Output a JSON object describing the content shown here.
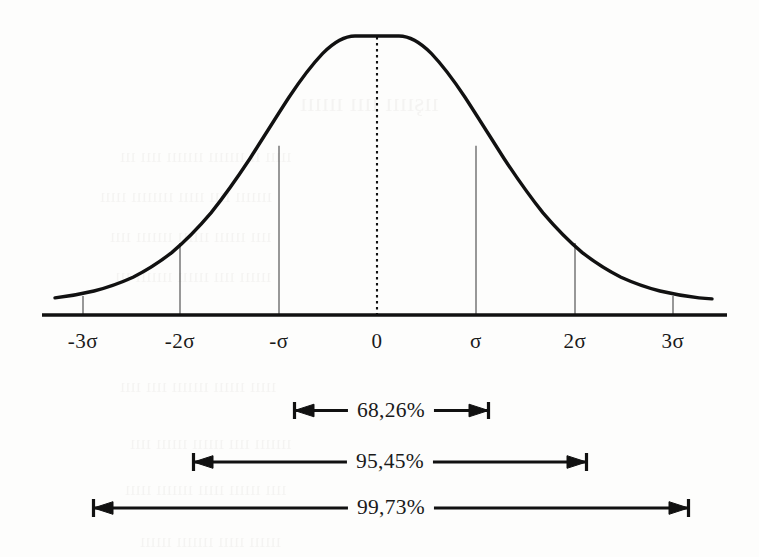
{
  "figure": {
    "background_color": "#fdfdfc",
    "ink_color": "#1a1a1a",
    "tick_color": "#555555"
  },
  "axis": {
    "labels": [
      {
        "text": "-3σ",
        "x": 83
      },
      {
        "text": "-2σ",
        "x": 180
      },
      {
        "text": "-σ",
        "x": 279
      },
      {
        "text": "0",
        "x": 377
      },
      {
        "text": "σ",
        "x": 476
      },
      {
        "text": "2σ",
        "x": 575
      },
      {
        "text": "3σ",
        "x": 673
      }
    ]
  },
  "bands": [
    {
      "label": "68,26%",
      "sigma": 1,
      "x_left": 293,
      "x_right": 490,
      "y": 410,
      "center": 391
    },
    {
      "label": "95,45%",
      "sigma": 2,
      "x_left": 192,
      "x_right": 588,
      "y": 462,
      "center": 390
    },
    {
      "label": "99,73%",
      "sigma": 3,
      "x_left": 92,
      "x_right": 690,
      "y": 508,
      "center": 391
    }
  ],
  "bleed_through": [
    {
      "text": "ıışıııı ıııı ıııııı",
      "x": 300,
      "y": 88,
      "size": 26
    },
    {
      "text": "ııııı ıı ııııııı ııııııı ıııı ııı",
      "x": 120,
      "y": 145,
      "size": 19
    },
    {
      "text": "ııııııı ıııı ııııı ıııııııı ııııı",
      "x": 100,
      "y": 185,
      "size": 19
    },
    {
      "text": "ıııı ıııııı ıııııı ııııııı ıııı",
      "x": 110,
      "y": 225,
      "size": 19
    },
    {
      "text": "ıııııı ıııı ıııııı ııııııı ııı",
      "x": 115,
      "y": 265,
      "size": 19
    },
    {
      "text": "ııııı ıııııı ııııııı ıııı ıııı",
      "x": 120,
      "y": 375,
      "size": 19
    },
    {
      "text": "ııııııı ıııı ıııııı ıııııı ıııı",
      "x": 130,
      "y": 432,
      "size": 19
    },
    {
      "text": "ıııı ıııııı ııııı ııııııı ııııı",
      "x": 125,
      "y": 478,
      "size": 19
    },
    {
      "text": "ıııııı ııııı ııııııı ıııııı",
      "x": 140,
      "y": 530,
      "size": 19
    }
  ],
  "chart_data": {
    "type": "line",
    "title": "",
    "xlabel": "",
    "ylabel": "",
    "distribution": "gaussian",
    "mean": 0,
    "std_dev": 1,
    "x": [
      -3,
      -2,
      -1,
      0,
      1,
      2,
      3
    ],
    "tick_labels": [
      "-3σ",
      "-2σ",
      "-σ",
      "0",
      "σ",
      "2σ",
      "3σ"
    ],
    "values": [
      0.0111,
      0.1353,
      0.6065,
      1.0,
      0.6065,
      0.1353,
      0.0111
    ],
    "xlim": [
      -3.6,
      3.6
    ],
    "ylim": [
      0,
      1.05
    ],
    "grid": false,
    "legend": null,
    "annotations": [
      {
        "label": "68,26%",
        "from": -1,
        "to": 1,
        "value": 68.26
      },
      {
        "label": "95,45%",
        "from": -2,
        "to": 2,
        "value": 95.45
      },
      {
        "label": "99,73%",
        "from": -3,
        "to": 3,
        "value": 99.73
      }
    ],
    "dropline_sigmas": [
      -3,
      -2,
      -1,
      1,
      2,
      3
    ],
    "center_line": {
      "x": 0,
      "style": "dotted"
    }
  }
}
